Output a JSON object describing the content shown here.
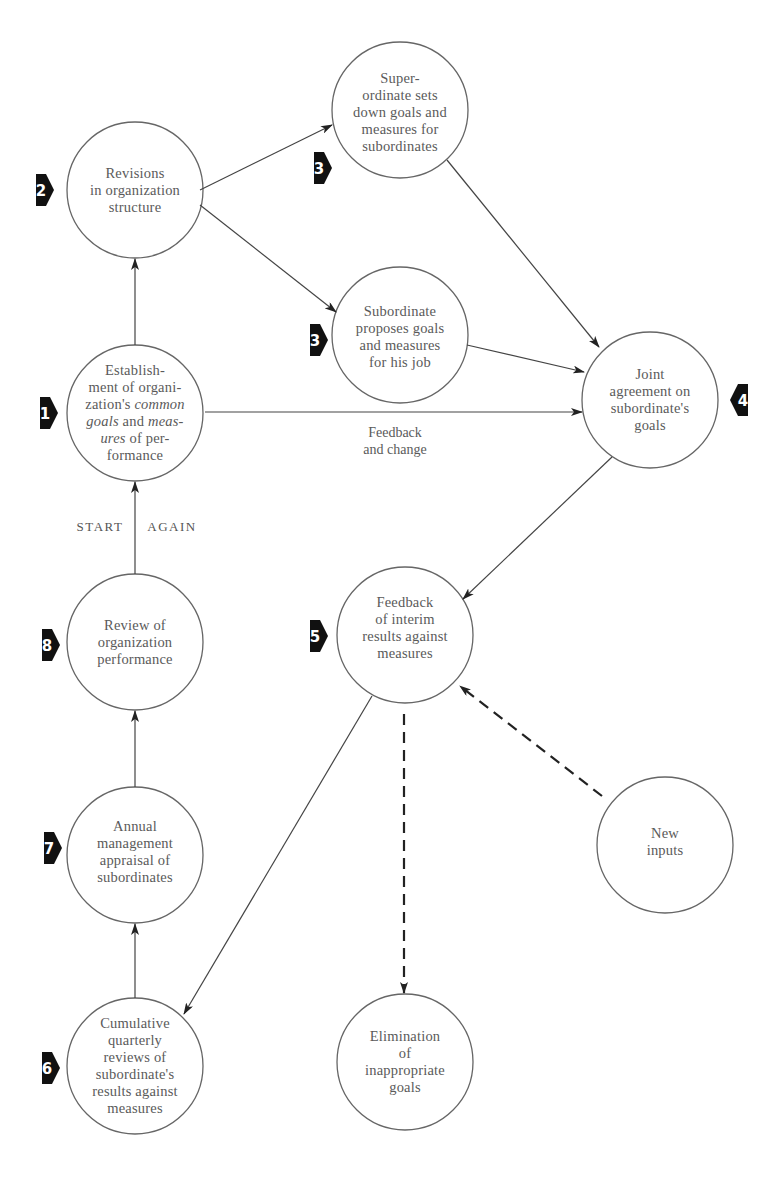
{
  "diagram": {
    "type": "management-by-objectives-cycle",
    "colors": {
      "stroke": "#555555",
      "text": "#5a5a5a",
      "badge": "#111111",
      "background": "#ffffff"
    },
    "nodes": [
      {
        "id": "n1",
        "step": "1",
        "label": "Establish-\nment of organi-\nzation's common\ngoals and meas-\nures of per-\nformance"
      },
      {
        "id": "n2",
        "step": "2",
        "label": "Revisions\nin organization\nstructure"
      },
      {
        "id": "n3a",
        "step": "3",
        "label": "Super-\nordinate sets\ndown goals and\nmeasures for\nsubordinates"
      },
      {
        "id": "n3b",
        "step": "3",
        "label": "Subordinate\nproposes goals\nand measures\nfor his job"
      },
      {
        "id": "n4",
        "step": "4",
        "label": "Joint\nagreement on\nsubordinate's\ngoals"
      },
      {
        "id": "n5",
        "step": "5",
        "label": "Feedback\nof interim\nresults against\nmeasures"
      },
      {
        "id": "n6",
        "step": "6",
        "label": "Cumulative\nquarterly\nreviews of\nsubordinate's\nresults against\nmeasures"
      },
      {
        "id": "n7",
        "step": "7",
        "label": "Annual\nmanagement\nappraisal of\nsubordinates"
      },
      {
        "id": "n8",
        "step": "8",
        "label": "Review of\norganization\nperformance"
      },
      {
        "id": "new",
        "step": "",
        "label": "New\ninputs"
      },
      {
        "id": "elim",
        "step": "",
        "label": "Elimination\nof\ninappropriate\ngoals"
      }
    ],
    "edges": [
      {
        "from": "n1",
        "to": "n2",
        "style": "solid"
      },
      {
        "from": "n2",
        "to": "n3a",
        "style": "solid"
      },
      {
        "from": "n2",
        "to": "n3b",
        "style": "solid"
      },
      {
        "from": "n3a",
        "to": "n4",
        "style": "solid"
      },
      {
        "from": "n3b",
        "to": "n4",
        "style": "solid"
      },
      {
        "from": "n1",
        "to": "n4",
        "style": "solid"
      },
      {
        "from": "n4",
        "to": "n5",
        "style": "solid"
      },
      {
        "from": "new",
        "to": "n5",
        "style": "dashed"
      },
      {
        "from": "n5",
        "to": "elim",
        "style": "dashed"
      },
      {
        "from": "n5",
        "to": "n6",
        "style": "solid"
      },
      {
        "from": "n6",
        "to": "n7",
        "style": "solid"
      },
      {
        "from": "n7",
        "to": "n8",
        "style": "solid"
      },
      {
        "from": "n8",
        "to": "n1",
        "style": "solid"
      }
    ],
    "edge_labels": {
      "feedback_change": "Feedback\nand change",
      "start": "START",
      "again": "AGAIN"
    },
    "node_text": {
      "n1_l1": "Establish-",
      "n1_l2": "ment of organi-",
      "n1_l3a": "zation's ",
      "n1_l3b": "common",
      "n1_l4a": "goals",
      "n1_l4b": " and ",
      "n1_l4c": "meas-",
      "n1_l5a": "ures",
      "n1_l5b": " of per-",
      "n1_l6": "formance"
    }
  }
}
